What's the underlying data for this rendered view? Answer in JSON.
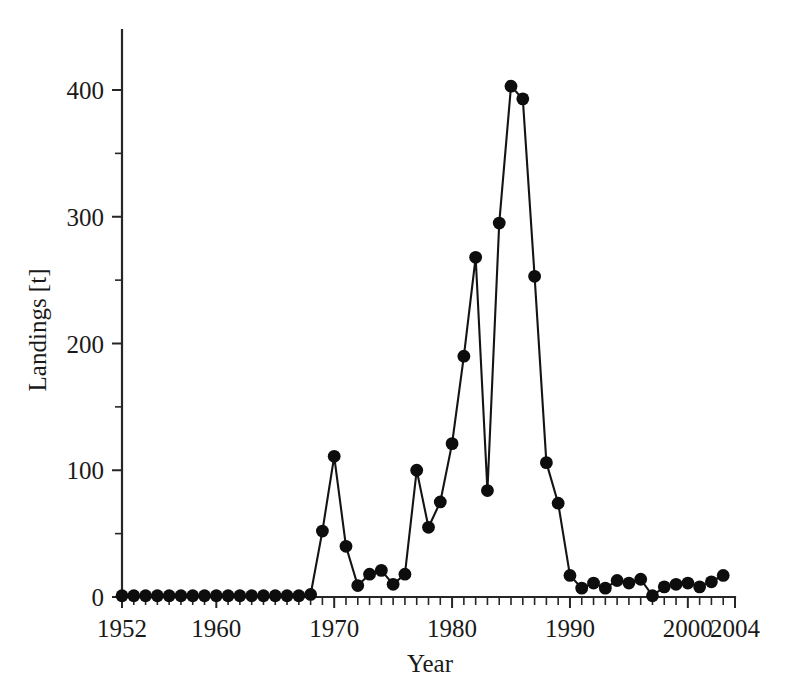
{
  "chart_data": {
    "type": "line",
    "title": "",
    "subtitle": "",
    "xlabel": "Year",
    "ylabel": "Landings [t]",
    "xlim": [
      1952,
      2004
    ],
    "ylim": [
      0,
      450
    ],
    "grid": false,
    "legend": null,
    "marker": "filled-circle",
    "x_ticks_major": [
      1952,
      1960,
      1970,
      1980,
      1990,
      2000,
      2004
    ],
    "x_tick_labels": [
      "1952",
      "1960",
      "1970",
      "1980",
      "1990",
      "2000",
      "2004"
    ],
    "x_minor_tick_step": 1,
    "y_ticks_major": [
      0,
      100,
      200,
      300,
      400
    ],
    "y_tick_labels": [
      "0",
      "100",
      "200",
      "300",
      "400"
    ],
    "y_minor_ticks": [
      50,
      150,
      250,
      350,
      450
    ],
    "series": [
      {
        "name": "Landings",
        "color": "#0d0d0d",
        "x": [
          1952,
          1953,
          1954,
          1955,
          1956,
          1957,
          1958,
          1959,
          1960,
          1961,
          1962,
          1963,
          1964,
          1965,
          1966,
          1967,
          1968,
          1969,
          1970,
          1971,
          1972,
          1973,
          1974,
          1975,
          1976,
          1977,
          1978,
          1979,
          1980,
          1981,
          1982,
          1983,
          1984,
          1985,
          1986,
          1987,
          1988,
          1989,
          1990,
          1991,
          1992,
          1993,
          1994,
          1995,
          1996,
          1997,
          1998,
          1999,
          2000,
          2001,
          2002,
          2003
        ],
        "values": [
          1,
          1,
          1,
          1,
          1,
          1,
          1,
          1,
          1,
          1,
          1,
          1,
          1,
          1,
          1,
          1,
          2,
          52,
          111,
          40,
          9,
          18,
          21,
          10,
          18,
          100,
          55,
          75,
          121,
          190,
          268,
          84,
          295,
          403,
          393,
          253,
          106,
          74,
          17,
          7,
          11,
          7,
          13,
          11,
          14,
          1,
          8,
          10,
          11,
          8,
          12,
          17
        ]
      }
    ]
  },
  "axes": {
    "y_label": "Landings [t]",
    "x_label": "Year"
  }
}
